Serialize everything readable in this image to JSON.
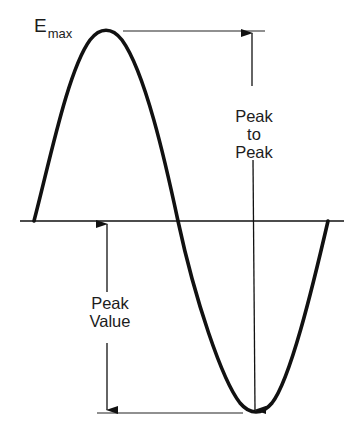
{
  "diagram": {
    "type": "sine-wave-amplitude",
    "labels": {
      "emax_main": "E",
      "emax_sub": "max",
      "peak_to_peak_1": "Peak",
      "peak_to_peak_2": "to",
      "peak_to_peak_3": "Peak",
      "peak_value_1": "Peak",
      "peak_value_2": "Value"
    },
    "colors": {
      "stroke": "#111111",
      "background": "#ffffff"
    }
  }
}
